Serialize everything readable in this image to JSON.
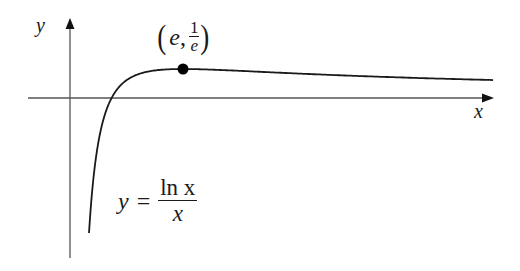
{
  "chart_data": {
    "type": "line",
    "title": "",
    "function": "y = ln x / x",
    "xlabel": "x",
    "ylabel": "y",
    "grid": false,
    "legend": null,
    "xlim": [
      -0.95,
      10.2
    ],
    "ylim": [
      -2.0,
      0.99
    ],
    "series": [
      {
        "name": "y = ln x / x",
        "x": [
          0.457,
          0.6,
          0.8,
          1.0,
          1.5,
          2.0,
          2.718,
          4.0,
          6.0,
          8.0,
          10.17
        ],
        "y": [
          -1.713,
          -0.851,
          -0.279,
          0.0,
          0.27,
          0.347,
          0.368,
          0.347,
          0.299,
          0.26,
          0.228
        ]
      }
    ],
    "annotations": [
      {
        "text": "(e, 1/e)",
        "x": 2.718,
        "y": 0.368,
        "marker": "filled-circle",
        "note": "maximum point"
      },
      {
        "text": "y = ln x / x",
        "position": "below curve, left-center"
      }
    ]
  },
  "labels": {
    "y_axis": "y",
    "x_axis": "x",
    "point_e": "e",
    "point_comma": ",",
    "point_num": "1",
    "point_den": "e",
    "paren_open": "(",
    "paren_close": ")",
    "eq_lhs": "y",
    "eq_sign": "=",
    "eq_num": "ln x",
    "eq_den": "x"
  },
  "colors": {
    "curve": "#1a1a1a",
    "axes": "#555555",
    "background": "#ffffff"
  }
}
